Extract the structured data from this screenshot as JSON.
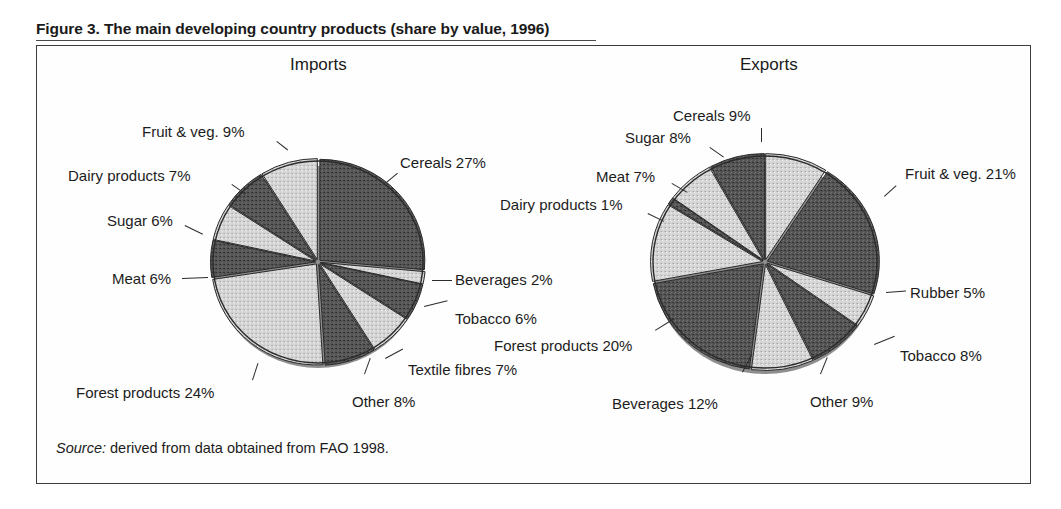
{
  "figure": {
    "caption": "Figure 3. The main developing country products (share by value, 1996)",
    "source_label": "Source:",
    "source_text": " derived from data obtained from FAO 1998."
  },
  "panels": {
    "imports_heading": "Imports",
    "exports_heading": "Exports"
  },
  "colors": {
    "dark_slice": "#4f4f4f",
    "light_slice": "#d2d2d2",
    "outline": "#2b2b2b",
    "frame": "#3d3d3d",
    "text": "#1c1c1c"
  },
  "labels": {
    "imports": {
      "cereals": "Cereals 27%",
      "beverages": "Beverages 2%",
      "tobacco": "Tobacco 6%",
      "textile_fibres": "Textile fibres 7%",
      "other": "Other 8%",
      "forest_products": "Forest products 24%",
      "meat": "Meat 6%",
      "sugar": "Sugar 6%",
      "dairy_products": "Dairy products 7%",
      "fruit_veg": "Fruit & veg. 9%"
    },
    "exports": {
      "cereals": "Cereals 9%",
      "fruit_veg": "Fruit & veg. 21%",
      "rubber": "Rubber 5%",
      "tobacco": "Tobacco 8%",
      "other": "Other 9%",
      "forest_products": "Forest products 20%",
      "beverages": "Beverages 12%",
      "dairy_products": "Dairy products 1%",
      "meat": "Meat 7%",
      "sugar": "Sugar 8%"
    }
  },
  "chart_data": [
    {
      "type": "pie",
      "title": "Imports",
      "unit": "percent share by value",
      "start_angle_deg": -90,
      "direction": "clockwise",
      "categories": [
        "Cereals",
        "Beverages",
        "Tobacco",
        "Textile fibres",
        "Other",
        "Forest products",
        "Meat",
        "Sugar",
        "Dairy products",
        "Fruit & veg."
      ],
      "values": [
        27,
        2,
        6,
        7,
        8,
        24,
        6,
        6,
        7,
        9
      ],
      "labels": [
        "Cereals 27%",
        "Beverages 2%",
        "Tobacco 6%",
        "Textile fibres 7%",
        "Other 8%",
        "Forest products 24%",
        "Meat 6%",
        "Sugar 6%",
        "Dairy products 7%",
        "Fruit & veg. 9%"
      ],
      "slice_fills": [
        "dark",
        "light",
        "dark",
        "light",
        "dark",
        "light",
        "dark",
        "light",
        "dark",
        "light"
      ],
      "legend": "none",
      "grid": false
    },
    {
      "type": "pie",
      "title": "Exports",
      "unit": "percent share by value",
      "start_angle_deg": -90,
      "direction": "clockwise",
      "categories": [
        "Cereals",
        "Fruit & veg.",
        "Rubber",
        "Tobacco",
        "Other",
        "Forest products",
        "Beverages",
        "Dairy products",
        "Meat",
        "Sugar"
      ],
      "values": [
        9,
        21,
        5,
        8,
        9,
        20,
        12,
        1,
        7,
        8
      ],
      "labels": [
        "Cereals 9%",
        "Fruit & veg. 21%",
        "Rubber 5%",
        "Tobacco 8%",
        "Other 9%",
        "Forest products 20%",
        "Beverages 12%",
        "Dairy products 1%",
        "Meat 7%",
        "Sugar 8%"
      ],
      "slice_fills": [
        "light",
        "dark",
        "light",
        "dark",
        "light",
        "dark",
        "light",
        "dark",
        "light",
        "dark"
      ],
      "legend": "none",
      "grid": false
    }
  ]
}
